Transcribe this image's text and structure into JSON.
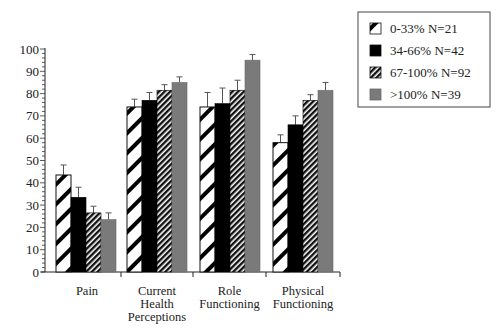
{
  "chart_data": {
    "type": "bar",
    "title": "",
    "xlabel": "",
    "ylabel": "",
    "ylim": [
      0,
      100
    ],
    "yticks": [
      0,
      10,
      20,
      30,
      40,
      50,
      60,
      70,
      80,
      90,
      100
    ],
    "grid": false,
    "legend_position": "top-right",
    "categories": [
      [
        "Pain"
      ],
      [
        "Current",
        "Health",
        "Perceptions"
      ],
      [
        "Role",
        "Functioning"
      ],
      [
        "Physical",
        "Functioning"
      ]
    ],
    "series": [
      {
        "name": "0-33% N=21",
        "pattern": "wide-diagonal-hatch",
        "color": "#ffffff",
        "values": [
          43.5,
          74,
          74,
          58
        ],
        "errors": [
          4.5,
          3.5,
          6.5,
          3.5
        ]
      },
      {
        "name": "34-66% N=42",
        "pattern": "solid",
        "color": "#000000",
        "values": [
          33.5,
          77,
          75.5,
          66
        ],
        "errors": [
          4.5,
          3.5,
          7,
          4
        ]
      },
      {
        "name": "67-100% N=92",
        "pattern": "fine-diagonal-hatch",
        "color": "#2a2a2a",
        "values": [
          26.5,
          81.5,
          81.5,
          77
        ],
        "errors": [
          3,
          2.5,
          4.5,
          2.5
        ]
      },
      {
        "name": ">100% N=39",
        "pattern": "solid",
        "color": "#7a7a7a",
        "values": [
          23.5,
          85,
          95,
          81.5
        ],
        "errors": [
          3,
          2.5,
          2.5,
          3.5
        ]
      }
    ]
  }
}
